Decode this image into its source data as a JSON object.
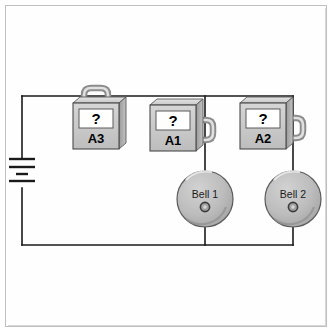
{
  "diagram": {
    "background_color": "#ffffff",
    "frame_color": "#bfbfbf",
    "wire_color": "#1a1a1a",
    "device_fill": "#c9c9c9",
    "device_stroke": "#4a4a4a",
    "display_fill": "#ffffff"
  },
  "battery": {
    "name": "battery",
    "symbol": "cell-stack",
    "plates": 4
  },
  "meters": [
    {
      "id": "A3",
      "label": "A3",
      "display_value": "?",
      "connector": "top-loop",
      "x": 73,
      "y": 103,
      "width": 46,
      "height": 46
    },
    {
      "id": "A1",
      "label": "A1",
      "display_value": "?",
      "connector": "right-loop",
      "x": 150,
      "y": 105,
      "width": 46,
      "height": 46
    },
    {
      "id": "A2",
      "label": "A2",
      "display_value": "?",
      "connector": "right-loop",
      "x": 240,
      "y": 103,
      "width": 46,
      "height": 46
    }
  ],
  "bells": [
    {
      "id": "bell1",
      "label": "Bell 1",
      "cx": 205,
      "cy": 199,
      "r": 28
    },
    {
      "id": "bell2",
      "label": "Bell 2",
      "cx": 293,
      "cy": 199,
      "r": 28
    }
  ],
  "wires": {
    "top_y": 96,
    "bottom_y": 245,
    "left_x": 22,
    "right_x": 293
  }
}
